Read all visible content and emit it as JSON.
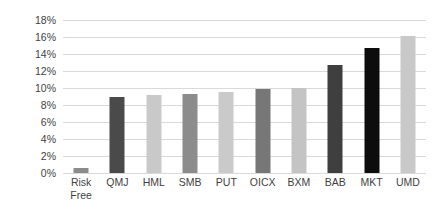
{
  "chart_data": {
    "type": "bar",
    "title": "",
    "subtitle": "",
    "xlabel": "",
    "ylabel": "",
    "categories": [
      "Risk\nFree",
      "QMJ",
      "HML",
      "SMB",
      "PUT",
      "OICX",
      "BXM",
      "BAB",
      "MKT",
      "UMD"
    ],
    "values": [
      0.6,
      9.0,
      9.2,
      9.35,
      9.55,
      9.9,
      10.0,
      12.65,
      14.75,
      16.1
    ],
    "bar_colors": [
      "#8c8c8c",
      "#4a4a4a",
      "#c9c9c9",
      "#8c8c8c",
      "#cacaca",
      "#777777",
      "#c4c4c4",
      "#3f3f3f",
      "#0d0d0d",
      "#c9c9c9"
    ],
    "ylim": [
      0,
      18
    ],
    "ytick_step": 2,
    "ytick_labels": [
      "0%",
      "2%",
      "4%",
      "6%",
      "8%",
      "10%",
      "12%",
      "14%",
      "16%",
      "18%"
    ],
    "ytick_values": [
      0,
      2,
      4,
      6,
      8,
      10,
      12,
      14,
      16,
      18
    ],
    "grid": "horizontal",
    "gridline_color": "#d9d9d9",
    "legend": "none",
    "legend_position": "",
    "annotations": [],
    "background_color": "#ffffff",
    "text_color": "#3f3f3f"
  }
}
